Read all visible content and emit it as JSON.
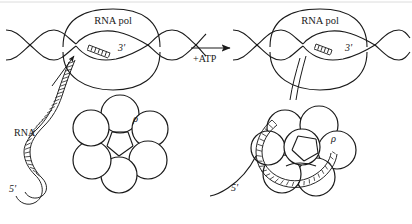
{
  "figure": {
    "title_visible": false,
    "background_color": "#ffffff",
    "ink_color": "#1a1a1a",
    "panels": [
      {
        "id": "before",
        "position": "left",
        "labels": {
          "rna_polymerase": "RNA pol",
          "three_prime": "3'",
          "rna": "RNA",
          "five_prime": "5'",
          "rho": "ρ"
        },
        "elements": {
          "dna_duplex": "double-helix-strand",
          "transcription_bubble": "open-bubble",
          "rna_transcript": "hatched-ribbon-free",
          "rho_hexamer": "six-circle-ring-open",
          "rho_subunit_count": 6,
          "rna_engaged_with_rho": false
        }
      },
      {
        "id": "after",
        "position": "right",
        "labels": {
          "rna_polymerase": "RNA pol",
          "three_prime": "3'",
          "five_prime": "5'",
          "rho": "ρ"
        },
        "elements": {
          "dna_duplex": "double-helix-strand",
          "transcription_bubble": "open-bubble",
          "rna_transcript": "hatched-ribbon-threaded",
          "rho_hexamer": "six-circle-ring-loaded",
          "rho_subunit_count": 6,
          "rna_engaged_with_rho": true
        }
      }
    ],
    "reaction_arrow": {
      "label": "+ATP",
      "direction": "left-to-right"
    }
  }
}
